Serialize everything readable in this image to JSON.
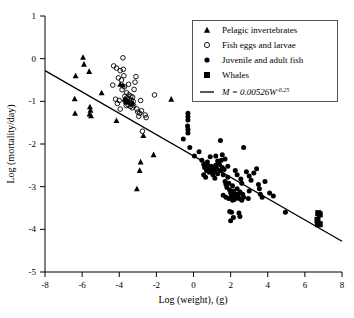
{
  "chart_data": {
    "type": "scatter",
    "title": "",
    "xlabel": "Log (weight), (g)",
    "ylabel": "Log (mortality/day)",
    "xlim": [
      -8,
      8
    ],
    "ylim": [
      -5,
      1
    ],
    "xticks": [
      -8,
      -6,
      -4,
      -2,
      0,
      2,
      4,
      6,
      8
    ],
    "yticks": [
      1,
      0,
      -1,
      -2,
      -3,
      -4,
      -5
    ],
    "xtick_labels": [
      "-8",
      "-6",
      "-4",
      "-2",
      "0",
      "2",
      "4",
      "6",
      "8"
    ],
    "ytick_labels": [
      "1",
      "0",
      "-1",
      "-2",
      "-3",
      "-4",
      "-5"
    ],
    "grid": false,
    "legend_position": "top-right",
    "fit_line": {
      "label": "M = 0.00526W",
      "exponent": "-0.25",
      "intercept": -2.279,
      "slope": -0.25,
      "x_start": -8,
      "y_start": -0.28,
      "x_end": 8,
      "y_end": -4.28
    },
    "series": [
      {
        "name": "Pelagic invertebrates",
        "marker": "triangle",
        "filled": true,
        "points": [
          [
            -6.35,
            -0.4
          ],
          [
            -6.4,
            -0.94
          ],
          [
            -6.38,
            -1.28
          ],
          [
            -5.95,
            0.03
          ],
          [
            -5.9,
            -0.13
          ],
          [
            -5.62,
            -0.3
          ],
          [
            -5.58,
            -1.13
          ],
          [
            -5.55,
            -1.21
          ],
          [
            -5.52,
            -1.34
          ],
          [
            -5.6,
            -1.3
          ],
          [
            -4.95,
            -0.8
          ],
          [
            -4.15,
            -1.45
          ],
          [
            -3.95,
            -0.6
          ],
          [
            -3.8,
            -0.62
          ],
          [
            -3.7,
            -0.95
          ],
          [
            -3.62,
            -1.0
          ],
          [
            -3.55,
            -1.0
          ],
          [
            -3.3,
            -1.05
          ],
          [
            -3.05,
            -3.05
          ],
          [
            -2.9,
            -2.62
          ],
          [
            -2.85,
            -2.42
          ],
          [
            -2.7,
            -1.8
          ],
          [
            -2.15,
            -2.25
          ],
          [
            -1.2,
            -0.95
          ]
        ]
      },
      {
        "name": "Fish eggs and larvae",
        "marker": "circle",
        "filled": false,
        "points": [
          [
            -4.3,
            -0.17
          ],
          [
            -4.15,
            -0.22
          ],
          [
            -4.05,
            -0.45
          ],
          [
            -3.95,
            -0.28
          ],
          [
            -3.88,
            -0.5
          ],
          [
            -3.85,
            -0.73
          ],
          [
            -3.8,
            0.02
          ],
          [
            -3.78,
            -0.25
          ],
          [
            -3.75,
            -0.4
          ],
          [
            -3.72,
            -0.66
          ],
          [
            -3.7,
            -0.88
          ],
          [
            -3.68,
            -0.97
          ],
          [
            -3.65,
            -1.03
          ],
          [
            -3.62,
            -1.1
          ],
          [
            -3.6,
            -0.8
          ],
          [
            -3.58,
            -0.92
          ],
          [
            -3.55,
            -1.0
          ],
          [
            -3.52,
            -1.08
          ],
          [
            -3.5,
            -0.6
          ],
          [
            -3.48,
            -0.85
          ],
          [
            -3.45,
            -0.95
          ],
          [
            -3.42,
            -1.02
          ],
          [
            -3.4,
            -1.12
          ],
          [
            -3.38,
            -0.88
          ],
          [
            -3.35,
            -0.98
          ],
          [
            -3.32,
            -1.05
          ],
          [
            -3.3,
            -1.15
          ],
          [
            -3.28,
            -0.9
          ],
          [
            -3.25,
            -1.0
          ],
          [
            -3.22,
            -1.1
          ],
          [
            -3.2,
            -0.72
          ],
          [
            -3.15,
            -0.55
          ],
          [
            -3.1,
            -0.42
          ],
          [
            -3.05,
            -1.18
          ],
          [
            -3.0,
            -1.25
          ],
          [
            -2.95,
            -1.35
          ],
          [
            -2.9,
            -1.28
          ],
          [
            -2.85,
            -0.98
          ],
          [
            -2.8,
            -1.22
          ],
          [
            -2.75,
            -1.7
          ],
          [
            -2.6,
            -1.32
          ],
          [
            -2.55,
            -1.38
          ],
          [
            -4.2,
            -0.95
          ],
          [
            -4.1,
            -1.05
          ],
          [
            -4.35,
            -0.62
          ],
          [
            -2.1,
            -0.85
          ],
          [
            -3.95,
            -1.18
          ],
          [
            -4.0,
            -0.98
          ]
        ]
      },
      {
        "name": "Juvenile and adult fish",
        "marker": "circle",
        "filled": true,
        "points": [
          [
            -0.3,
            -1.28
          ],
          [
            -0.3,
            -1.36
          ],
          [
            -0.3,
            -1.44
          ],
          [
            -0.32,
            -1.58
          ],
          [
            -0.3,
            -1.66
          ],
          [
            -0.3,
            -1.74
          ],
          [
            -0.55,
            -1.88
          ],
          [
            -0.2,
            -2.08
          ],
          [
            0.05,
            -2.28
          ],
          [
            0.3,
            -2.18
          ],
          [
            0.45,
            -2.38
          ],
          [
            0.55,
            -2.48
          ],
          [
            0.6,
            -2.55
          ],
          [
            0.7,
            -2.62
          ],
          [
            0.75,
            -2.5
          ],
          [
            0.8,
            -2.58
          ],
          [
            0.85,
            -2.66
          ],
          [
            0.9,
            -2.6
          ],
          [
            0.95,
            -2.52
          ],
          [
            1.0,
            -2.58
          ],
          [
            1.05,
            -2.64
          ],
          [
            1.1,
            -2.55
          ],
          [
            1.15,
            -2.62
          ],
          [
            1.2,
            -2.5
          ],
          [
            1.25,
            -2.58
          ],
          [
            1.3,
            -2.7
          ],
          [
            1.35,
            -2.42
          ],
          [
            1.4,
            -2.48
          ],
          [
            1.45,
            -2.62
          ],
          [
            1.5,
            -2.38
          ],
          [
            1.55,
            -2.55
          ],
          [
            1.6,
            -2.72
          ],
          [
            1.65,
            -2.6
          ],
          [
            1.7,
            -2.88
          ],
          [
            1.75,
            -2.95
          ],
          [
            1.8,
            -3.02
          ],
          [
            1.85,
            -2.78
          ],
          [
            1.9,
            -2.92
          ],
          [
            1.95,
            -3.08
          ],
          [
            2.0,
            -3.15
          ],
          [
            2.05,
            -3.22
          ],
          [
            2.1,
            -2.98
          ],
          [
            2.15,
            -3.1
          ],
          [
            2.2,
            -3.2
          ],
          [
            2.25,
            -3.25
          ],
          [
            2.3,
            -3.18
          ],
          [
            2.35,
            -3.05
          ],
          [
            2.4,
            -3.22
          ],
          [
            2.45,
            -3.28
          ],
          [
            2.5,
            -3.12
          ],
          [
            2.55,
            -2.82
          ],
          [
            2.6,
            -2.92
          ],
          [
            2.65,
            -3.18
          ],
          [
            2.7,
            -2.08
          ],
          [
            1.55,
            -2.25
          ],
          [
            1.7,
            -2.35
          ],
          [
            1.45,
            -1.92
          ],
          [
            0.55,
            -2.72
          ],
          [
            0.65,
            -2.78
          ],
          [
            0.75,
            -2.42
          ],
          [
            2.05,
            -3.6
          ],
          [
            2.15,
            -3.72
          ],
          [
            2.0,
            -3.8
          ],
          [
            2.45,
            -3.62
          ],
          [
            2.5,
            -3.7
          ],
          [
            1.95,
            -3.58
          ],
          [
            3.0,
            -2.75
          ],
          [
            3.1,
            -2.85
          ],
          [
            3.25,
            -2.68
          ],
          [
            3.4,
            -2.58
          ],
          [
            3.5,
            -2.95
          ],
          [
            3.55,
            -3.05
          ],
          [
            3.6,
            -3.18
          ],
          [
            3.7,
            -3.25
          ],
          [
            3.85,
            -2.88
          ],
          [
            4.1,
            -3.15
          ],
          [
            4.3,
            -3.22
          ],
          [
            3.0,
            -3.1
          ],
          [
            2.85,
            -2.65
          ],
          [
            2.95,
            -3.28
          ],
          [
            4.95,
            -3.6
          ],
          [
            1.2,
            -2.28
          ],
          [
            1.3,
            -2.4
          ],
          [
            0.9,
            -2.3
          ],
          [
            1.05,
            -2.72
          ],
          [
            1.15,
            -2.8
          ],
          [
            1.85,
            -2.52
          ],
          [
            2.25,
            -2.62
          ],
          [
            2.35,
            -2.72
          ],
          [
            2.6,
            -3.32
          ],
          [
            2.7,
            -3.25
          ],
          [
            1.6,
            -3.2
          ],
          [
            1.75,
            -3.25
          ],
          [
            1.9,
            -3.28
          ],
          [
            2.1,
            -3.32
          ],
          [
            2.2,
            -3.3
          ]
        ]
      },
      {
        "name": "Whales",
        "marker": "square",
        "filled": true,
        "points": [
          [
            6.72,
            -3.62
          ],
          [
            6.8,
            -3.65
          ],
          [
            6.68,
            -3.78
          ],
          [
            6.7,
            -3.88
          ],
          [
            6.8,
            -3.88
          ]
        ]
      }
    ]
  },
  "legend": {
    "items": [
      {
        "label": "Pelagic invertebrates",
        "marker": "triangle"
      },
      {
        "label": "Fish eggs and larvae",
        "marker": "open-circle"
      },
      {
        "label": "Juvenile and adult fish",
        "marker": "filled-circle"
      },
      {
        "label": "Whales",
        "marker": "square"
      }
    ],
    "equation_main": "M = 0.00526W",
    "equation_exponent": "-0.25"
  }
}
